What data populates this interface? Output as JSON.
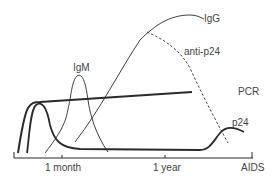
{
  "diagram": {
    "type": "time-course of HIV infection markers",
    "x_axis": {
      "ticks": [
        {
          "label": "1 month",
          "x": 62
        },
        {
          "label": "1 year",
          "x": 165
        },
        {
          "label": "AIDS",
          "x": 252
        }
      ]
    },
    "curves": [
      {
        "name": "IgM",
        "label": "IgM",
        "style": "thin solid",
        "shape": "early sharp peak around 1 month, returns to baseline"
      },
      {
        "name": "IgG",
        "label": "IgG",
        "style": "thin solid",
        "shape": "rises after IgM, peaks and plateaus at top through to AIDS"
      },
      {
        "name": "anti-p24",
        "label": "anti-p24",
        "style": "dashed",
        "shape": "branches from IgG, declines toward late stage"
      },
      {
        "name": "PCR",
        "label": "PCR",
        "style": "thick solid",
        "shape": "rapid early rise then near-constant high level"
      },
      {
        "name": "p24",
        "label": "p24",
        "style": "thick solid",
        "shape": "early peak, low baseline for years, rises again near AIDS"
      }
    ],
    "labels": {
      "igm": "IgM",
      "igg": "IgG",
      "anti_p24": "anti-p24",
      "pcr": "PCR",
      "p24": "p24",
      "tick_month": "1 month",
      "tick_year": "1 year",
      "tick_aids": "AIDS"
    },
    "colors": {
      "line": "#2a2a2a",
      "text": "#444444",
      "background": "#ffffff"
    }
  }
}
